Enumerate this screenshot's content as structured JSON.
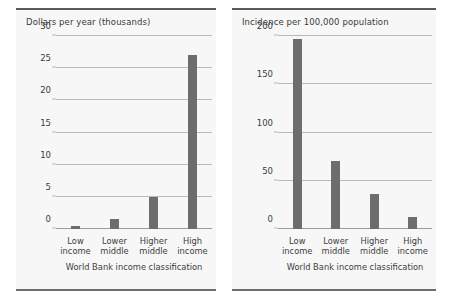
{
  "figure": {
    "background": "#ffffff",
    "panel_background": "#f7f7f7",
    "bar_color": "#6d6d6d",
    "grid_color": "#b9b9b9",
    "rule_color": "#5a5a5e"
  },
  "panels": [
    {
      "name": "dollars-per-year",
      "title": "Dollars per year (thousands)",
      "axis_caption": "World Bank income classification"
    },
    {
      "name": "incidence-per-100000",
      "title": "Incidence per 100,000 population",
      "axis_caption": "World Bank income classification"
    }
  ],
  "chart_data": [
    {
      "type": "bar",
      "title": "Dollars per year (thousands)",
      "xlabel": "World Bank income classification",
      "ylabel": "Dollars per year (thousands)",
      "categories": [
        "Low income",
        "Lower middle",
        "Higher middle",
        "High income"
      ],
      "category_lines": [
        [
          "Low",
          "income"
        ],
        [
          "Lower",
          "middle"
        ],
        [
          "Higher",
          "middle"
        ],
        [
          "High",
          "income"
        ]
      ],
      "values": [
        0.4,
        1.5,
        5.0,
        27.0
      ],
      "ylim": [
        0,
        30
      ],
      "yticks": [
        0,
        5,
        10,
        15,
        20,
        25,
        30
      ],
      "ytick_labels": [
        "0",
        "5",
        "10",
        "15",
        "20",
        "25",
        "30"
      ],
      "grid": true,
      "legend": "none"
    },
    {
      "type": "bar",
      "title": "Incidence per 100,000 population",
      "xlabel": "World Bank income classification",
      "ylabel": "Incidence per 100,000 population",
      "categories": [
        "Low income",
        "Lower middle",
        "Higher middle",
        "High income"
      ],
      "category_lines": [
        [
          "Low",
          "income"
        ],
        [
          "Lower",
          "middle"
        ],
        [
          "Higher",
          "middle"
        ],
        [
          "High",
          "income"
        ]
      ],
      "values": [
        197,
        70,
        36,
        12
      ],
      "ylim": [
        0,
        200
      ],
      "yticks": [
        0,
        50,
        100,
        150,
        200
      ],
      "ytick_labels": [
        "0",
        "50",
        "100",
        "150",
        "200"
      ],
      "grid": true,
      "legend": "none"
    }
  ]
}
